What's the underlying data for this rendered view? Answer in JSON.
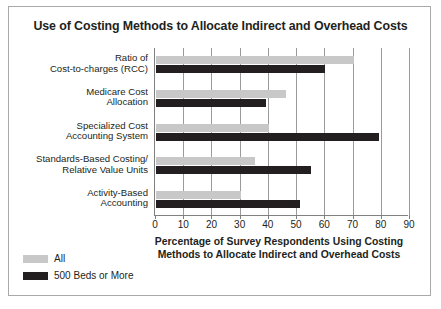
{
  "chart_data": {
    "type": "bar",
    "orientation": "horizontal",
    "title": "Use of Costing Methods to Allocate Indirect and Overhead Costs",
    "xlabel": "Percentage of Survey Respondents Using Costing Methods to Allocate Indirect and Overhead Costs",
    "xlabel_line1": "Percentage of Survey Respondents Using Costing",
    "xlabel_line2": "Methods to Allocate Indirect and Overhead Costs",
    "ylabel": "",
    "xlim": [
      0,
      90
    ],
    "xticks": [
      "0",
      "10",
      "20",
      "30",
      "40",
      "50",
      "60",
      "70",
      "80",
      "90"
    ],
    "grid": true,
    "legend_position": "bottom-left",
    "categories": [
      "Ratio of Cost-to-charges (RCC)",
      "Medicare Cost Allocation",
      "Specialized Cost Accounting System",
      "Standards-Based Costing/ Relative Value Units",
      "Activity-Based Accounting"
    ],
    "category_lines": [
      [
        "Ratio of",
        "Cost-to-charges (RCC)"
      ],
      [
        "Medicare Cost",
        "Allocation"
      ],
      [
        "Specialized Cost",
        "Accounting System"
      ],
      [
        "Standards-Based Costing/",
        "Relative Value Units"
      ],
      [
        "Activity-Based",
        "Accounting"
      ]
    ],
    "series": [
      {
        "name": "All",
        "color": "#c8c8c8",
        "values": [
          70,
          46,
          40,
          35,
          30
        ]
      },
      {
        "name": "500 Beds or More",
        "color": "#231f20",
        "values": [
          60,
          39,
          79,
          55,
          51
        ]
      }
    ]
  }
}
